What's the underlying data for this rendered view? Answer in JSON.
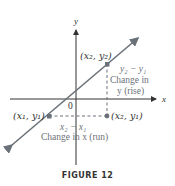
{
  "figure": {
    "caption": "FIGURE 12",
    "axes": {
      "x_label": "x",
      "y_label": "y",
      "origin_label": "0"
    },
    "points": {
      "p1": "(x₁, y₁)",
      "p2": "(x₂, y₂)",
      "p3": "(x₂, y₁)"
    },
    "rise": {
      "expr": "y₂ − y₁",
      "line1": "Change in",
      "line2": "y (rise)"
    },
    "run": {
      "expr": "x₂ − x₁",
      "text": "Change in x (run)"
    },
    "colors": {
      "line": "#6a7178",
      "dashed": "#6a7178",
      "axis": "#333333",
      "label": "#6d7278"
    }
  }
}
